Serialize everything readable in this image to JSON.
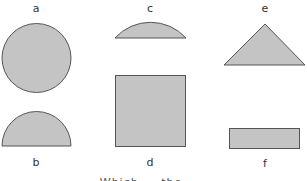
{
  "diagram": {
    "fill_color": "#c4c4c4",
    "stroke_color": "#555555",
    "shapes": [
      {
        "id": "a",
        "label": "a",
        "type": "circle"
      },
      {
        "id": "b",
        "label": "b",
        "type": "semicircle"
      },
      {
        "id": "c",
        "label": "c",
        "type": "circular-segment"
      },
      {
        "id": "d",
        "label": "d",
        "type": "square"
      },
      {
        "id": "e",
        "label": "e",
        "type": "triangle"
      },
      {
        "id": "f",
        "label": "f",
        "type": "rectangle"
      }
    ],
    "caption": "Which ... the ..."
  }
}
